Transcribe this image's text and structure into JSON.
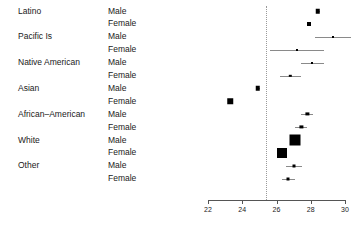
{
  "chart_data": {
    "type": "scatter",
    "title": "",
    "xlabel": "",
    "ylabel": "",
    "xlim": [
      21.5,
      30.5
    ],
    "grid": false,
    "legend": "none",
    "reference_line": 25.4,
    "xticks": [
      22,
      24,
      26,
      28,
      30
    ],
    "xtick_labels": [
      "22",
      "24",
      "26",
      "28",
      "30"
    ],
    "group_labels": [
      "Latino",
      "Pacific Is",
      "Native American",
      "Asian",
      "African–American",
      "White",
      "Other"
    ],
    "sex_labels": [
      "Male",
      "Female"
    ],
    "rows": [
      {
        "group": "Latino",
        "sex": "Male",
        "estimate": 28.4,
        "ci_low": 28.28,
        "ci_high": 28.52,
        "box": 4.5
      },
      {
        "group": "Latino",
        "sex": "Female",
        "estimate": 27.9,
        "ci_low": 27.78,
        "ci_high": 28.02,
        "box": 4.0
      },
      {
        "group": "Pacific Is",
        "sex": "Male",
        "estimate": 29.3,
        "ci_low": 28.25,
        "ci_high": 30.35,
        "box": 2.0
      },
      {
        "group": "Pacific Is",
        "sex": "Female",
        "estimate": 27.2,
        "ci_low": 25.6,
        "ci_high": 28.8,
        "box": 2.0
      },
      {
        "group": "Native American",
        "sex": "Male",
        "estimate": 28.1,
        "ci_low": 27.45,
        "ci_high": 28.8,
        "box": 2.0
      },
      {
        "group": "Native American",
        "sex": "Female",
        "estimate": 26.8,
        "ci_low": 26.2,
        "ci_high": 27.45,
        "box": 2.4
      },
      {
        "group": "Asian",
        "sex": "Male",
        "estimate": 24.9,
        "ci_low": 24.78,
        "ci_high": 25.02,
        "box": 4.5
      },
      {
        "group": "Asian",
        "sex": "Female",
        "estimate": 23.3,
        "ci_low": 23.15,
        "ci_high": 23.45,
        "box": 5.5
      },
      {
        "group": "African–American",
        "sex": "Male",
        "estimate": 27.8,
        "ci_low": 27.45,
        "ci_high": 28.15,
        "box": 3.2
      },
      {
        "group": "African–American",
        "sex": "Female",
        "estimate": 27.45,
        "ci_low": 27.1,
        "ci_high": 27.8,
        "box": 3.2
      },
      {
        "group": "White",
        "sex": "Male",
        "estimate": 27.1,
        "ci_low": 27.0,
        "ci_high": 27.2,
        "box": 11.0
      },
      {
        "group": "White",
        "sex": "Female",
        "estimate": 26.3,
        "ci_low": 26.2,
        "ci_high": 26.4,
        "box": 10.0
      },
      {
        "group": "Other",
        "sex": "Male",
        "estimate": 27.0,
        "ci_low": 26.55,
        "ci_high": 27.5,
        "box": 3.0
      },
      {
        "group": "Other",
        "sex": "Female",
        "estimate": 26.7,
        "ci_low": 26.35,
        "ci_high": 27.1,
        "box": 3.0
      }
    ]
  },
  "axis": {
    "left_value": 22,
    "right_value": 30
  }
}
